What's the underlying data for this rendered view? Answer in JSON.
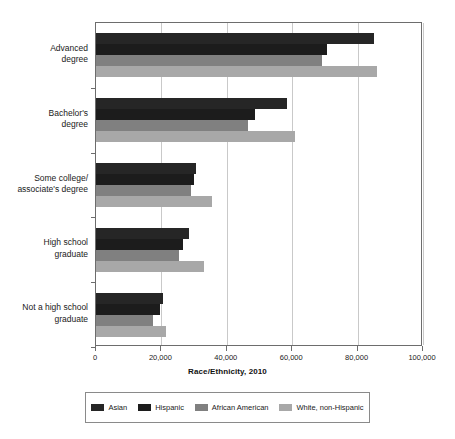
{
  "chart_data": {
    "type": "bar",
    "orientation": "horizontal",
    "title": "",
    "xlabel": "Race/Ethnicity, 2010",
    "ylabel": "",
    "xlim": [
      0,
      100000
    ],
    "xticks": [
      0,
      20000,
      40000,
      60000,
      80000,
      100000
    ],
    "xticklabels": [
      "0",
      "20,000",
      "40,000",
      "60,000",
      "80,000",
      "100,000"
    ],
    "grid": "vertical",
    "legend_position": "bottom",
    "categories": [
      "Advanced degree",
      "Bachelor's degree",
      "Some college/associate's degree",
      "High school graduate",
      "Not a high school graduate"
    ],
    "category_lines": [
      [
        "Advanced",
        "degree"
      ],
      [
        "Bachelor's",
        "degree"
      ],
      [
        "Some college/",
        "associate's degree"
      ],
      [
        "High school",
        "graduate"
      ],
      [
        "Not a high school",
        "graduate"
      ]
    ],
    "series": [
      {
        "name": "Asian",
        "color": "#262626",
        "values": [
          85000,
          58500,
          30500,
          28500,
          20500
        ]
      },
      {
        "name": "Hispanic",
        "color": "#1c1c1c",
        "values": [
          70500,
          48500,
          30000,
          26500,
          19500
        ]
      },
      {
        "name": "African American",
        "color": "#808080",
        "values": [
          69000,
          46500,
          29000,
          25500,
          17500
        ]
      },
      {
        "name": "White, non-Hispanic",
        "color": "#a8a8a8",
        "values": [
          86000,
          61000,
          35500,
          33000,
          21500
        ]
      }
    ]
  },
  "legend": {
    "items": [
      {
        "label": "Asian",
        "color": "#262626"
      },
      {
        "label": "Hispanic",
        "color": "#1c1c1c"
      },
      {
        "label": "African American",
        "color": "#808080"
      },
      {
        "label": "White, non-Hispanic",
        "color": "#a8a8a8"
      }
    ]
  },
  "axis_title": "Race/Ethnicity, 2010"
}
